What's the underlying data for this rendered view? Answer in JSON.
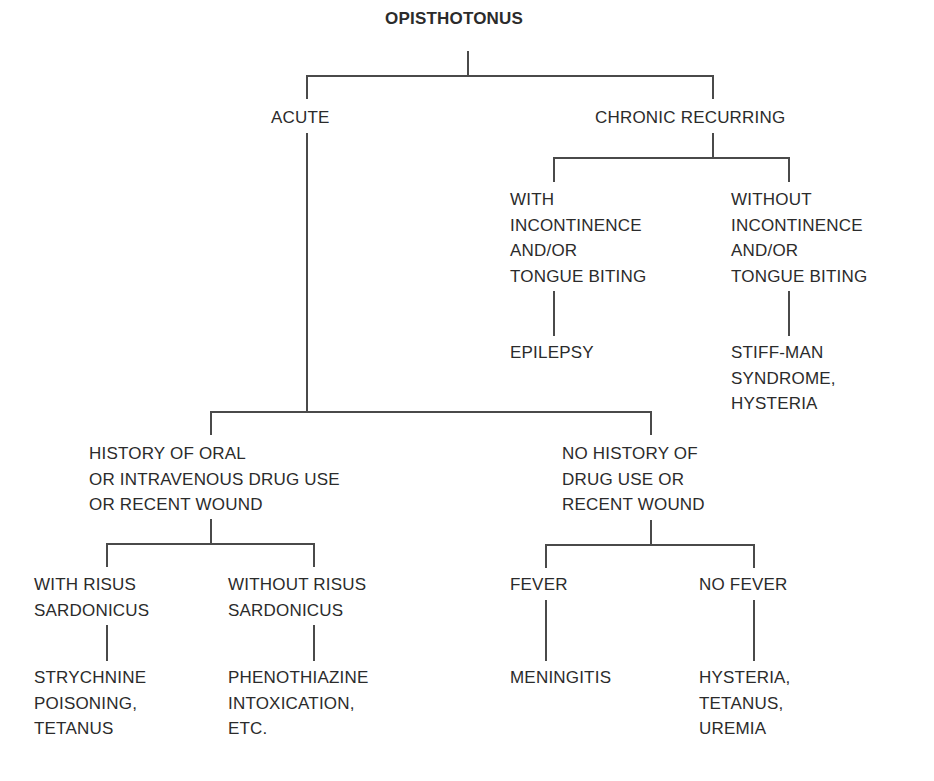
{
  "diagram": {
    "type": "decision-tree",
    "root": "OPISTHOTONUS",
    "nodes": {
      "acute": "ACUTE",
      "chronic": "CHRONIC RECURRING",
      "with_incontinence": "WITH\nINCONTINENCE\nAND/OR\nTONGUE BITING",
      "without_incontinence": "WITHOUT\nINCONTINENCE\nAND/OR\nTONGUE BITING",
      "epilepsy": "EPILEPSY",
      "stiff_man": "STIFF-MAN\nSYNDROME,\nHYSTERIA",
      "history_drug": "HISTORY OF ORAL\nOR INTRAVENOUS DRUG USE\nOR RECENT WOUND",
      "no_history_drug": "NO HISTORY OF\nDRUG USE OR\nRECENT WOUND",
      "with_risus": "WITH RISUS\nSARDONICUS",
      "without_risus": "WITHOUT RISUS\nSARDONICUS",
      "fever": "FEVER",
      "no_fever": "NO FEVER",
      "strychnine": "STRYCHNINE\nPOISONING,\nTETANUS",
      "phenothiazine": "PHENOTHIAZINE\nINTOXICATION,\nETC.",
      "meningitis": "MENINGITIS",
      "hysteria_tetanus": "HYSTERIA,\nTETANUS,\nUREMIA"
    },
    "edges": [
      [
        "OPISTHOTONUS",
        "ACUTE"
      ],
      [
        "OPISTHOTONUS",
        "CHRONIC RECURRING"
      ],
      [
        "CHRONIC RECURRING",
        "WITH INCONTINENCE AND/OR TONGUE BITING"
      ],
      [
        "CHRONIC RECURRING",
        "WITHOUT INCONTINENCE AND/OR TONGUE BITING"
      ],
      [
        "WITH INCONTINENCE AND/OR TONGUE BITING",
        "EPILEPSY"
      ],
      [
        "WITHOUT INCONTINENCE AND/OR TONGUE BITING",
        "STIFF-MAN SYNDROME, HYSTERIA"
      ],
      [
        "ACUTE",
        "HISTORY OF ORAL OR INTRAVENOUS DRUG USE OR RECENT WOUND"
      ],
      [
        "ACUTE",
        "NO HISTORY OF DRUG USE OR RECENT WOUND"
      ],
      [
        "HISTORY OF ORAL OR INTRAVENOUS DRUG USE OR RECENT WOUND",
        "WITH RISUS SARDONICUS"
      ],
      [
        "HISTORY OF ORAL OR INTRAVENOUS DRUG USE OR RECENT WOUND",
        "WITHOUT RISUS SARDONICUS"
      ],
      [
        "WITH RISUS SARDONICUS",
        "STRYCHNINE POISONING, TETANUS"
      ],
      [
        "WITHOUT RISUS SARDONICUS",
        "PHENOTHIAZINE INTOXICATION, ETC."
      ],
      [
        "NO HISTORY OF DRUG USE OR RECENT WOUND",
        "FEVER"
      ],
      [
        "NO HISTORY OF DRUG USE OR RECENT WOUND",
        "NO FEVER"
      ],
      [
        "FEVER",
        "MENINGITIS"
      ],
      [
        "NO FEVER",
        "HYSTERIA, TETANUS, UREMIA"
      ]
    ],
    "line_color": "#4a4a4a",
    "text_color": "#2b2b2b"
  }
}
